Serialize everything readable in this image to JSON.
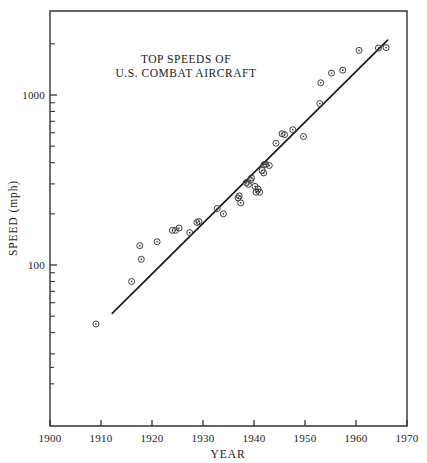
{
  "chart_data": {
    "type": "scatter",
    "title": "TOP SPEEDS OF U.S. COMBAT AIRCRAFT",
    "title_lines": [
      "TOP SPEEDS OF",
      "U.S. COMBAT AIRCRAFT"
    ],
    "xlabel": "YEAR",
    "ylabel": "SPEED (mph)",
    "xlim": [
      1900,
      1970
    ],
    "ylim": [
      20,
      2600
    ],
    "yscale": "log",
    "xscale": "linear",
    "grid": false,
    "legend": null,
    "x_ticks": [
      1900,
      1910,
      1920,
      1930,
      1940,
      1950,
      1960,
      1970
    ],
    "x_tick_labels": [
      "1900",
      "1910",
      "1920",
      "1930",
      "1940",
      "1950",
      "1960",
      "1970"
    ],
    "y_ticks": [
      100,
      1000
    ],
    "y_tick_labels": [
      "100",
      "1000"
    ],
    "y_minor_ticks": [
      30,
      40,
      50,
      60,
      70,
      80,
      90,
      200,
      300,
      400,
      500,
      600,
      700,
      800,
      900,
      2000
    ],
    "points": [
      {
        "x": 1909,
        "y": 45
      },
      {
        "x": 1916,
        "y": 80
      },
      {
        "x": 1917.6,
        "y": 130
      },
      {
        "x": 1917.9,
        "y": 108
      },
      {
        "x": 1921,
        "y": 137
      },
      {
        "x": 1924,
        "y": 160
      },
      {
        "x": 1924.6,
        "y": 160
      },
      {
        "x": 1925.3,
        "y": 165
      },
      {
        "x": 1927.4,
        "y": 155
      },
      {
        "x": 1928.8,
        "y": 178
      },
      {
        "x": 1929.2,
        "y": 180
      },
      {
        "x": 1932.8,
        "y": 215
      },
      {
        "x": 1934.0,
        "y": 200
      },
      {
        "x": 1936.9,
        "y": 248
      },
      {
        "x": 1937.1,
        "y": 255
      },
      {
        "x": 1937.4,
        "y": 232
      },
      {
        "x": 1938.5,
        "y": 305
      },
      {
        "x": 1938.9,
        "y": 298
      },
      {
        "x": 1939.3,
        "y": 315
      },
      {
        "x": 1939.5,
        "y": 325
      },
      {
        "x": 1940.2,
        "y": 290
      },
      {
        "x": 1940.4,
        "y": 268
      },
      {
        "x": 1940.8,
        "y": 280
      },
      {
        "x": 1941.1,
        "y": 268
      },
      {
        "x": 1941.6,
        "y": 360
      },
      {
        "x": 1941.9,
        "y": 348
      },
      {
        "x": 1942.0,
        "y": 390
      },
      {
        "x": 1942.3,
        "y": 392
      },
      {
        "x": 1943.0,
        "y": 385
      },
      {
        "x": 1944.3,
        "y": 520
      },
      {
        "x": 1945.5,
        "y": 592
      },
      {
        "x": 1946.0,
        "y": 585
      },
      {
        "x": 1947.6,
        "y": 625
      },
      {
        "x": 1949.7,
        "y": 570
      },
      {
        "x": 1952.9,
        "y": 890
      },
      {
        "x": 1953.1,
        "y": 1180
      },
      {
        "x": 1955.2,
        "y": 1345
      },
      {
        "x": 1957.4,
        "y": 1400
      },
      {
        "x": 1960.6,
        "y": 1830
      },
      {
        "x": 1964.4,
        "y": 1890
      },
      {
        "x": 1965.9,
        "y": 1900
      }
    ],
    "trend_line": {
      "label": "fitted exponential trend",
      "x_start": 1912.2,
      "y_start": 52,
      "x_end": 1966.2,
      "y_end": 2100
    }
  },
  "figure": {
    "background_color": "#ffffff",
    "axis_color": "#333333",
    "marker_color": "#3b3b3b",
    "line_color": "#1a1a1a"
  }
}
